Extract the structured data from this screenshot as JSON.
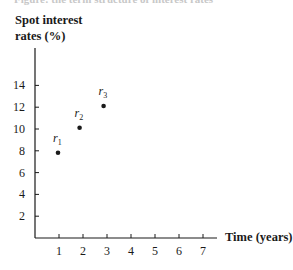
{
  "header": {
    "cutoff_title": "Figure: the term structure of interest rates"
  },
  "chart_data": {
    "type": "scatter",
    "title": "",
    "xlabel": "Time (years)",
    "ylabel": "Spot interest rates (%)",
    "ylabel_lines": [
      "Spot interest",
      "rates (%)"
    ],
    "xlim": [
      0,
      7.5
    ],
    "ylim": [
      0,
      16
    ],
    "x_ticks": [
      1,
      2,
      3,
      4,
      5,
      6,
      7
    ],
    "y_ticks": [
      2,
      4,
      6,
      8,
      10,
      12,
      14
    ],
    "grid": false,
    "legend": null,
    "series": [
      {
        "name": "Spot rates",
        "points": [
          {
            "label": "r",
            "sub": "1",
            "x": 1,
            "y": 8.0
          },
          {
            "label": "r",
            "sub": "2",
            "x": 1.9,
            "y": 10.3
          },
          {
            "label": "r",
            "sub": "3",
            "x": 2.9,
            "y": 12.3
          }
        ]
      }
    ],
    "colors": {
      "points": "#1a1a1a",
      "axis": "#1a1a1a"
    }
  }
}
